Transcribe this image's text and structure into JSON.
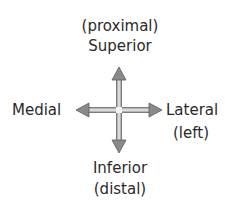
{
  "diagram": {
    "top": {
      "line1": "(proximal)",
      "line2": "Superior"
    },
    "bottom": {
      "line1": "Inferior",
      "line2": "(distal)"
    },
    "left": {
      "line1": "Medial"
    },
    "right": {
      "line1": "Lateral",
      "line2": "(left)"
    },
    "arrow_fill": "#bdbdbd",
    "arrow_stroke": "#6a6a6a"
  }
}
